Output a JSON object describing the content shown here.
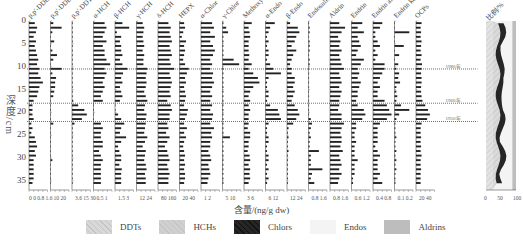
{
  "chart_data": {
    "type": "bar",
    "orientation": "horizontal",
    "title": "",
    "ylabel": "深度/cm",
    "xlabel": "含量/(ng/g dw)",
    "yaxis": {
      "range": [
        0,
        37
      ],
      "ticks": [
        0,
        5,
        10,
        15,
        20,
        25,
        30,
        35
      ],
      "inverted": true
    },
    "date_markers": [
      {
        "depth": 10.5,
        "label": "1980年"
      },
      {
        "depth": 18,
        "label": "1960年"
      },
      {
        "depth": 22,
        "label": "1950年"
      }
    ],
    "depths": [
      0.5,
      1.5,
      2.5,
      3.5,
      4.5,
      5.5,
      6.5,
      7.5,
      8.5,
      9.5,
      10.5,
      11.5,
      12.5,
      13.5,
      14.5,
      15.5,
      16.5,
      17.5,
      18.5,
      19.5,
      20.5,
      21.5,
      22.5,
      23.5,
      24.5,
      25.5,
      26.5,
      27.5,
      28.5,
      29.5,
      30.5,
      31.5,
      32.5,
      33.5,
      34.5,
      35.5
    ],
    "panels": [
      {
        "name": "p,p'-DDE",
        "xticks": [
          "0",
          "0.8",
          "1.6"
        ],
        "xmax": 1.6,
        "values": [
          0.5,
          0.7,
          0.6,
          0.4,
          0.6,
          0.5,
          0.6,
          0.7,
          0.8,
          0.7,
          0.9,
          0.8,
          1.0,
          1.2,
          0.9,
          0.8,
          0.7,
          0.4,
          0.3,
          0.3,
          0.3,
          0.4,
          0.2,
          0.3,
          0.2,
          0.5,
          0.6,
          0.7,
          0.5,
          0.6,
          0.4,
          0.4,
          0.4,
          0.4,
          0.4,
          0.3
        ]
      },
      {
        "name": "p,p'-DDD",
        "xticks": [
          "10",
          "20"
        ],
        "xmax": 20,
        "values": [
          3,
          12,
          2,
          0,
          4,
          0,
          2,
          7,
          3,
          0,
          12,
          2,
          6,
          5,
          5,
          4,
          3,
          0,
          0,
          0,
          0,
          0,
          3,
          0,
          0,
          0,
          0,
          0,
          0,
          0,
          2,
          0,
          0,
          0,
          0,
          0
        ]
      },
      {
        "name": "p,p'-DDT",
        "xticks": [
          "3.6",
          "15",
          "30"
        ],
        "xmax": 30,
        "values": [
          1,
          1,
          1,
          1,
          1,
          1,
          1,
          1,
          1,
          1,
          1,
          1,
          1,
          1,
          1,
          1,
          1,
          2,
          10,
          20,
          24,
          16,
          4,
          1,
          1,
          1,
          1,
          1,
          1,
          1,
          1,
          1,
          1,
          1,
          1,
          1
        ]
      },
      {
        "name": "α-HCH",
        "xticks": [
          "0.5",
          "1"
        ],
        "xmax": 1,
        "values": [
          0.6,
          0.7,
          0.6,
          0.5,
          0.7,
          0.5,
          0.6,
          0.6,
          0.7,
          0.9,
          0.6,
          0.7,
          0.6,
          0.5,
          0.6,
          0.5,
          0.4,
          0.5,
          0,
          0,
          0,
          0,
          0.4,
          0.5,
          0.4,
          0.4,
          0.5,
          0.5,
          0.3,
          0.4,
          0.5,
          0.4,
          0.4,
          0.4,
          0.4,
          0.4
        ]
      },
      {
        "name": "β-HCH",
        "xticks": [
          "1.5",
          "3"
        ],
        "xmax": 3,
        "values": [
          1.2,
          2.3,
          0.3,
          1.0,
          0.8,
          1.0,
          1.0,
          1.2,
          0.8,
          1.2,
          2.0,
          1.3,
          1.0,
          1.2,
          0.8,
          1.0,
          1.2,
          0.8,
          0,
          0,
          0.5,
          1.0,
          1.5,
          1.0,
          0.8,
          1.8,
          1.0,
          0.5,
          0.7,
          1.0,
          1.0,
          0.7,
          1.1,
          1.0,
          1.0,
          1.0
        ]
      },
      {
        "name": "γ-HCH",
        "xticks": [
          "12",
          "24"
        ],
        "xmax": 24,
        "values": [
          8,
          10,
          9,
          8,
          9,
          10,
          8,
          10,
          9,
          9,
          14,
          13,
          12,
          13,
          12,
          10,
          12,
          14,
          11,
          10,
          13,
          12,
          12,
          11,
          10,
          14,
          11,
          8,
          12,
          11,
          10,
          12,
          13,
          11,
          12,
          12
        ]
      },
      {
        "name": "δ-HCH",
        "xticks": [
          "80",
          "160"
        ],
        "xmax": 160,
        "values": [
          90,
          110,
          100,
          110,
          120,
          100,
          110,
          120,
          100,
          110,
          140,
          100,
          110,
          120,
          110,
          100,
          110,
          80,
          110,
          120,
          100,
          100,
          80,
          90,
          70,
          100,
          80,
          60,
          80,
          90,
          100,
          80,
          90,
          100,
          90,
          90
        ]
      },
      {
        "name": "HEPX",
        "xticks": [
          "20",
          "40"
        ],
        "xmax": 40,
        "values": [
          10,
          12,
          8,
          5,
          14,
          10,
          12,
          10,
          8,
          12,
          20,
          16,
          12,
          14,
          10,
          12,
          14,
          12,
          10,
          18,
          16,
          12,
          10,
          16,
          10,
          14,
          10,
          8,
          10,
          12,
          10,
          12,
          10,
          12,
          12,
          10
        ]
      },
      {
        "name": "α-Chlor",
        "xticks": [
          "1",
          "2"
        ],
        "xmax": 2,
        "values": [
          1.2,
          1.4,
          1.0,
          1.5,
          1.0,
          1.3,
          1.5,
          1.3,
          1.0,
          1.2,
          1.0,
          1.3,
          1.2,
          1.4,
          1.2,
          1.0,
          1.2,
          1.0,
          1.2,
          1.0,
          1.3,
          1.2,
          1.0,
          1.4,
          1.1,
          1.2,
          1.0,
          1.0,
          0.8,
          1.0,
          1.1,
          0.8,
          0.9,
          1.0,
          0.8,
          0.7
        ]
      },
      {
        "name": "γ-Chlor",
        "xticks": [
          "5",
          "10"
        ],
        "xmax": 10,
        "values": [
          0.5,
          2,
          3,
          0.5,
          0.5,
          0.5,
          0.5,
          0.5,
          6,
          9,
          0.5,
          0.5,
          0.5,
          0.5,
          0.5,
          0.5,
          0.5,
          0.5,
          0.5,
          0.5,
          0.5,
          0.5,
          0.5,
          0.5,
          0.5,
          4,
          0.5,
          0.5,
          0.5,
          0.5,
          0.5,
          0.5,
          0.5,
          0.5,
          0.5,
          0.5
        ]
      },
      {
        "name": "Methoxychlor",
        "xticks": [
          "3",
          "6"
        ],
        "xmax": 6,
        "values": [
          2.5,
          1.5,
          1.8,
          2.0,
          1.5,
          1.5,
          1.5,
          1.7,
          1.5,
          2.5,
          1.5,
          3.0,
          4.5,
          5.0,
          3.0,
          2.0,
          1.5,
          2.0,
          1.5,
          2.0,
          1.5,
          1.5,
          1.5,
          1.2,
          2.0,
          2.0,
          1.5,
          1.5,
          1.2,
          1.8,
          2.0,
          1.5,
          2.0,
          1.8,
          2.0,
          1.5
        ]
      },
      {
        "name": "α-Endo",
        "xticks": [
          "6",
          "12"
        ],
        "xmax": 12,
        "values": [
          6,
          3,
          2,
          1,
          2,
          1,
          2,
          2,
          1,
          3,
          5,
          10,
          2,
          1,
          1,
          2,
          2,
          1,
          3,
          8,
          9,
          10,
          2,
          1,
          1,
          2,
          2,
          1,
          1,
          2,
          2,
          1,
          2,
          1,
          2,
          1
        ]
      },
      {
        "name": "β-Endo",
        "xticks": [
          "12",
          "24"
        ],
        "xmax": 24,
        "values": [
          4,
          14,
          16,
          12,
          10,
          6,
          12,
          8,
          6,
          4,
          6,
          6,
          10,
          10,
          8,
          10,
          8,
          6,
          10,
          14,
          16,
          12,
          8,
          2,
          1,
          2,
          1,
          1,
          2,
          1,
          1,
          1,
          1,
          1,
          1,
          1
        ]
      },
      {
        "name": "Endosulfan sulfate",
        "xticks": [
          "0.8",
          "1.6"
        ],
        "xmax": 1.6,
        "values": [
          0.05,
          0.1,
          0.1,
          0.05,
          0.1,
          0.1,
          0.1,
          0.05,
          0.1,
          0.1,
          0.05,
          0.05,
          0.05,
          0.05,
          0.05,
          0.05,
          0.05,
          0.05,
          0.05,
          0.05,
          0.05,
          0.2,
          0.3,
          0.2,
          0.1,
          0.2,
          0.1,
          0.1,
          0.9,
          0.2,
          0.2,
          0.2,
          1.2,
          0.3,
          0.2,
          0.5
        ]
      },
      {
        "name": "Aldrin",
        "xticks": [
          "0.8",
          "1.6"
        ],
        "xmax": 1.6,
        "values": [
          0.8,
          1.3,
          1.0,
          0.7,
          0.9,
          0.8,
          1.0,
          0.8,
          0.9,
          1.0,
          1.2,
          0.8,
          0.9,
          1.0,
          0.8,
          1.0,
          0.9,
          0.8,
          0.8,
          0.7,
          1.0,
          1.0,
          1.2,
          1.0,
          0.9,
          1.0,
          1.0,
          0.9,
          1.1,
          0.8,
          0.9,
          1.0,
          0.8,
          1.0,
          0.8,
          0.7
        ]
      },
      {
        "name": "Endrin",
        "xticks": [
          "0.6",
          "1.2"
        ],
        "xmax": 1.2,
        "values": [
          0.7,
          0.4,
          0.8,
          0.4,
          0.5,
          0.6,
          0.4,
          0.3,
          0.8,
          0.6,
          0.4,
          0.5,
          0.4,
          0.6,
          0.5,
          0.4,
          0.4,
          0.3,
          0.4,
          0.8,
          0.9,
          0.7,
          0.3,
          0.3,
          0.2,
          0.2,
          0.3,
          0.2,
          0.2,
          0.2,
          0.4,
          0.2,
          0.2,
          0.2,
          0.1,
          0.1
        ]
      },
      {
        "name": "Endrin aldehyde",
        "xticks": [
          "0.4",
          "0.8"
        ],
        "xmax": 0.8,
        "values": [
          0.4,
          0.3,
          0.1,
          0.1,
          0.2,
          0.3,
          0.1,
          0.2,
          0.1,
          0.5,
          0.5,
          0.4,
          0.3,
          0.2,
          0.3,
          0.2,
          0.2,
          0.5,
          0.6,
          0.7,
          0.8,
          0.6,
          0.3,
          0.2,
          0.2,
          0.2,
          0.2,
          0.1,
          0.2,
          0.3,
          0.2,
          0.2,
          0.2,
          0.3,
          0.2,
          0.4
        ]
      },
      {
        "name": "Endrin ketone",
        "xticks": [
          "0.1",
          "0.2"
        ],
        "xmax": 0.2,
        "values": [
          0,
          0,
          0.16,
          0,
          0,
          0.1,
          0,
          0.05,
          0,
          0.04,
          0.02,
          0.05,
          0.04,
          0.06,
          0.02,
          0.02,
          0.03,
          0.02,
          0.07,
          0.16,
          0.05,
          0.02,
          0.01,
          0.01,
          0.01,
          0.02,
          0.01,
          0.01,
          0.02,
          0.01,
          0.02,
          0.01,
          0.02,
          0.01,
          0.01,
          0.01
        ]
      },
      {
        "name": "OCPs",
        "xticks": [
          "20",
          "40"
        ],
        "xmax": 40,
        "values": [
          12,
          10,
          11,
          10,
          12,
          11,
          10,
          12,
          10,
          13,
          12,
          11,
          12,
          12,
          11,
          11,
          12,
          14,
          20,
          26,
          30,
          24,
          12,
          10,
          10,
          11,
          10,
          11,
          10,
          12,
          10,
          10,
          11,
          10,
          10,
          10
        ]
      }
    ],
    "proportion_panel": {
      "title": "比例/%",
      "type": "area",
      "xticks": [
        "0",
        "50",
        "100"
      ],
      "xrange": [
        0,
        100
      ],
      "series": [
        {
          "name": "DDTs",
          "values_mean": 20
        },
        {
          "name": "HCHs",
          "values_mean": 30
        },
        {
          "name": "Chlors",
          "values_mean": 15
        },
        {
          "name": "Endos",
          "values_mean": 25
        },
        {
          "name": "Aldrins",
          "values_mean": 10
        }
      ]
    },
    "legend": [
      {
        "name": "DDTs",
        "color": "#d8d8d8",
        "pattern": "hatch"
      },
      {
        "name": "HCHs",
        "color": "#d0d0d0",
        "pattern": "hatch"
      },
      {
        "name": "Chlors",
        "color": "#262626",
        "pattern": "hatch"
      },
      {
        "name": "Endos",
        "color": "#f4f4f4",
        "pattern": "solid"
      },
      {
        "name": "Aldrins",
        "color": "#bdbdbd",
        "pattern": "solid"
      }
    ],
    "grid": false,
    "legend_position": "bottom"
  },
  "labels": {
    "ylabel": "深度/cm",
    "xlabel": "含量/(ng/g dw)",
    "prop_title": "比例/%"
  }
}
